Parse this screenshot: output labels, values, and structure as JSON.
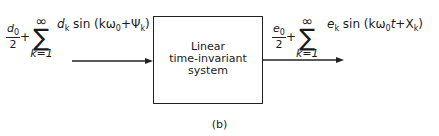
{
  "diagram": {
    "input": {
      "frac_num": "d",
      "frac_num_sub": "0",
      "frac_den": "2",
      "plus": "+",
      "sum_upper": "∞",
      "sum_symbol": "∑",
      "sum_lower": "k=1",
      "term_coef": "d",
      "term_coef_sub": "k",
      "term_func": "sin (kω",
      "term_omega_sub": "0",
      "term_phase": "+Ψ",
      "term_phase_sub": "k",
      "term_close": ")"
    },
    "block": {
      "line1": "Linear",
      "line2": "time-invariant",
      "line3": "system"
    },
    "output": {
      "frac_num": "e",
      "frac_num_sub": "0",
      "frac_den": "2",
      "plus": "+",
      "sum_upper": "∞",
      "sum_symbol": "∑",
      "sum_lower": "k=1",
      "term_coef": "e",
      "term_coef_sub": "k",
      "term_func": "sin (kω",
      "term_omega_sub": "0",
      "term_t": "t",
      "term_phase": "+X",
      "term_phase_sub": "k",
      "term_close": ")"
    },
    "caption": "(b)"
  }
}
